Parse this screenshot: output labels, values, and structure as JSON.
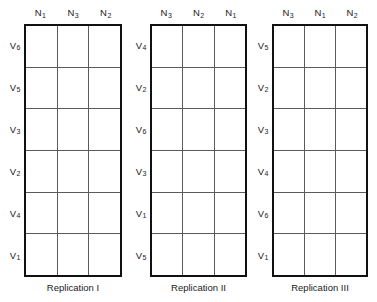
{
  "figure": {
    "title": "",
    "type": "split-plot-field-layout",
    "background_color": "#ffffff",
    "line_color": "#111111",
    "interior_line_color": "#5b5b5b"
  },
  "blocks": [
    {
      "id": "replication-1",
      "caption": "Replication I",
      "left": 24,
      "width": 98,
      "label_gutter_left": 2,
      "label_gutter_width": 22,
      "column_headers": [
        {
          "letter": "N",
          "sub": "1"
        },
        {
          "letter": "N",
          "sub": "3"
        },
        {
          "letter": "N",
          "sub": "2"
        }
      ],
      "row_labels": [
        {
          "letter": "V",
          "sub": "6"
        },
        {
          "letter": "V",
          "sub": "5"
        },
        {
          "letter": "V",
          "sub": "3"
        },
        {
          "letter": "V",
          "sub": "2"
        },
        {
          "letter": "V",
          "sub": "4"
        },
        {
          "letter": "V",
          "sub": "1"
        }
      ]
    },
    {
      "id": "replication-2",
      "caption": "Replication II",
      "left": 150,
      "width": 97,
      "label_gutter_left": 128,
      "label_gutter_width": 22,
      "column_headers": [
        {
          "letter": "N",
          "sub": "3"
        },
        {
          "letter": "N",
          "sub": "2"
        },
        {
          "letter": "N",
          "sub": "1"
        }
      ],
      "row_labels": [
        {
          "letter": "V",
          "sub": "4"
        },
        {
          "letter": "V",
          "sub": "2"
        },
        {
          "letter": "V",
          "sub": "6"
        },
        {
          "letter": "V",
          "sub": "3"
        },
        {
          "letter": "V",
          "sub": "1"
        },
        {
          "letter": "V",
          "sub": "5"
        }
      ]
    },
    {
      "id": "replication-3",
      "caption": "Replication III",
      "left": 272,
      "width": 96,
      "label_gutter_left": 250,
      "label_gutter_width": 22,
      "column_headers": [
        {
          "letter": "N",
          "sub": "3"
        },
        {
          "letter": "N",
          "sub": "1"
        },
        {
          "letter": "N",
          "sub": "2"
        }
      ],
      "row_labels": [
        {
          "letter": "V",
          "sub": "5"
        },
        {
          "letter": "V",
          "sub": "2"
        },
        {
          "letter": "V",
          "sub": "3"
        },
        {
          "letter": "V",
          "sub": "4"
        },
        {
          "letter": "V",
          "sub": "6"
        },
        {
          "letter": "V",
          "sub": "1"
        }
      ]
    }
  ]
}
